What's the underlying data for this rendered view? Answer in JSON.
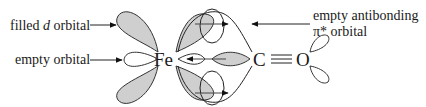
{
  "diagram": {
    "labels": {
      "filled_d": {
        "pre": "filled ",
        "italic": "d",
        "post": " orbital"
      },
      "empty_orbital": "empty orbital",
      "antibonding_line1": "empty antibonding",
      "antibonding_line2_symbol": "π*",
      "antibonding_line2_text": " orbital"
    },
    "atoms": {
      "metal": "Fe",
      "carbon": "C",
      "oxygen": "O"
    },
    "bond": "triple",
    "colors": {
      "filled_lobe": "#cfcfcf",
      "outline": "#333333",
      "text": "#1a1a1a",
      "background": "#ffffff"
    }
  }
}
